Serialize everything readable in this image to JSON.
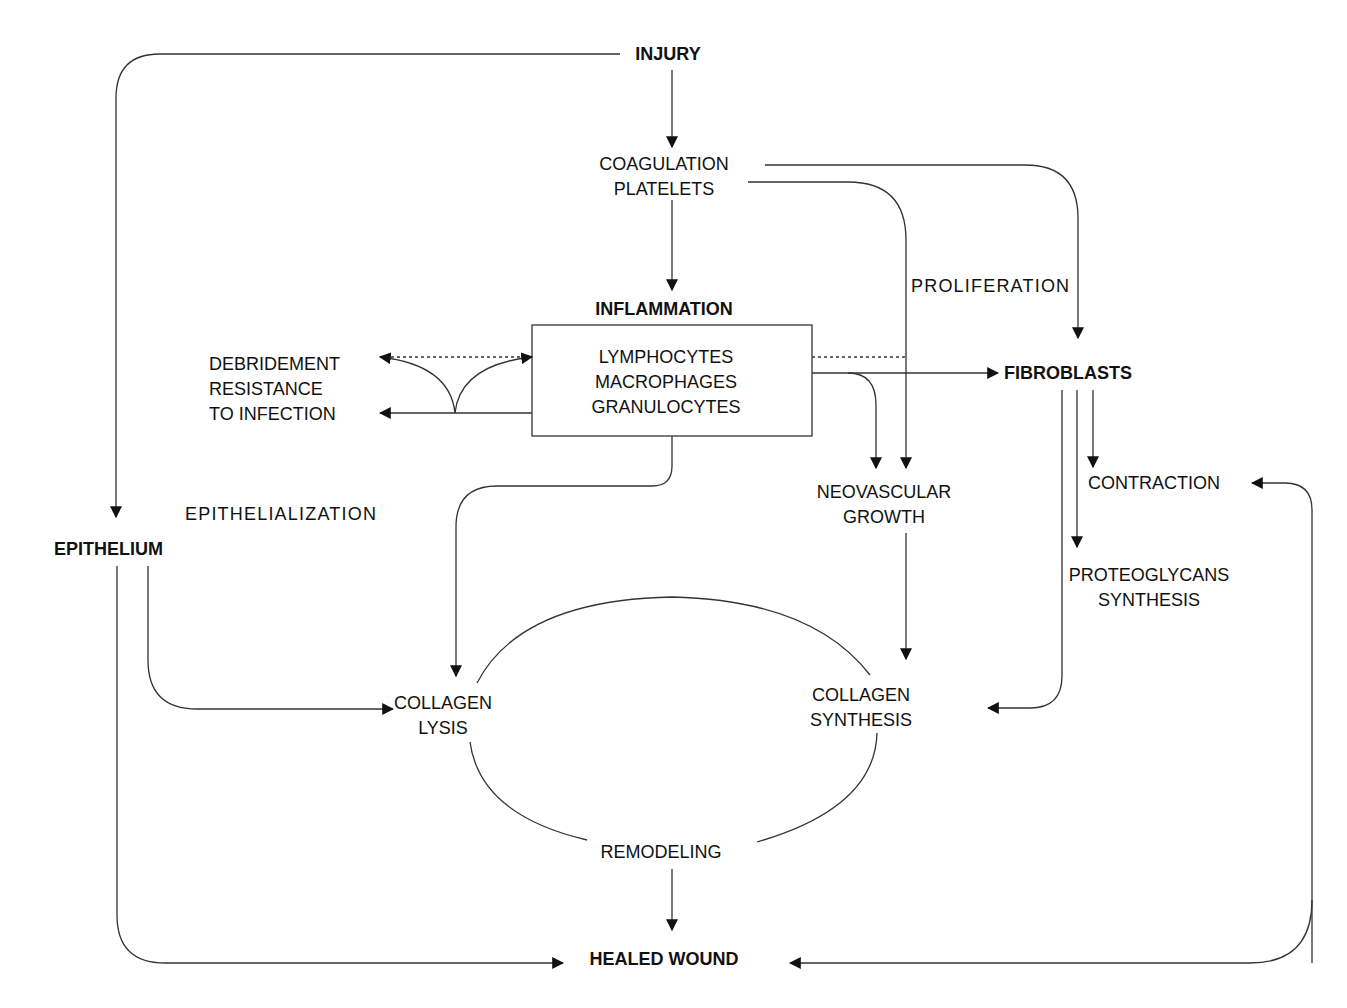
{
  "diagram": {
    "type": "flowchart",
    "nodes": {
      "injury": {
        "label": "INJURY"
      },
      "coagulation": {
        "lines": [
          "COAGULATION",
          "PLATELETS"
        ]
      },
      "inflammation": {
        "label": "INFLAMMATION"
      },
      "inflammation_box": {
        "lines": [
          "LYMPHOCYTES",
          "MACROPHAGES",
          "GRANULOCYTES"
        ]
      },
      "debridement": {
        "lines": [
          "DEBRIDEMENT",
          "RESISTANCE",
          "TO INFECTION"
        ]
      },
      "proliferation": {
        "label": "PROLIFERATION"
      },
      "fibroblasts": {
        "label": "FIBROBLASTS"
      },
      "neovascular": {
        "lines": [
          "NEOVASCULAR",
          "GROWTH"
        ]
      },
      "contraction": {
        "label": "CONTRACTION"
      },
      "proteoglycans": {
        "lines": [
          "PROTEOGLYCANS",
          "SYNTHESIS"
        ]
      },
      "epithelialization": {
        "label": "EPITHELIALIZATION"
      },
      "epithelium": {
        "label": "EPITHELIUM"
      },
      "collagen_lysis": {
        "lines": [
          "COLLAGEN",
          "LYSIS"
        ]
      },
      "collagen_synthesis": {
        "lines": [
          "COLLAGEN",
          "SYNTHESIS"
        ]
      },
      "remodeling": {
        "label": "REMODELING"
      },
      "healed_wound": {
        "label": "HEALED WOUND"
      }
    },
    "edges": [
      {
        "from": "INJURY",
        "to": "COAGULATION PLATELETS"
      },
      {
        "from": "INJURY",
        "to": "EPITHELIUM"
      },
      {
        "from": "COAGULATION PLATELETS",
        "to": "INFLAMMATION"
      },
      {
        "from": "COAGULATION PLATELETS",
        "to": "FIBROBLASTS"
      },
      {
        "from": "COAGULATION PLATELETS",
        "to": "NEOVASCULAR GROWTH"
      },
      {
        "from": "INFLAMMATION",
        "to": "DEBRIDEMENT / RESISTANCE TO INFECTION"
      },
      {
        "from": "INFLAMMATION",
        "to": "FIBROBLASTS"
      },
      {
        "from": "INFLAMMATION",
        "to": "NEOVASCULAR GROWTH"
      },
      {
        "from": "INFLAMMATION",
        "to": "COLLAGEN LYSIS"
      },
      {
        "from": "FIBROBLASTS",
        "to": "CONTRACTION"
      },
      {
        "from": "FIBROBLASTS",
        "to": "PROTEOGLYCANS SYNTHESIS"
      },
      {
        "from": "FIBROBLASTS",
        "to": "COLLAGEN SYNTHESIS"
      },
      {
        "from": "NEOVASCULAR GROWTH",
        "to": "COLLAGEN SYNTHESIS"
      },
      {
        "from": "EPITHELIUM",
        "to": "COLLAGEN LYSIS"
      },
      {
        "from": "EPITHELIUM",
        "to": "HEALED WOUND"
      },
      {
        "from": "REMODELING",
        "to": "HEALED WOUND"
      },
      {
        "from": "HEALED WOUND",
        "to": "CONTRACTION",
        "bidirectional_loop": true
      }
    ],
    "colors": {
      "line": "#222222",
      "text": "#111111",
      "background": "#ffffff"
    }
  }
}
